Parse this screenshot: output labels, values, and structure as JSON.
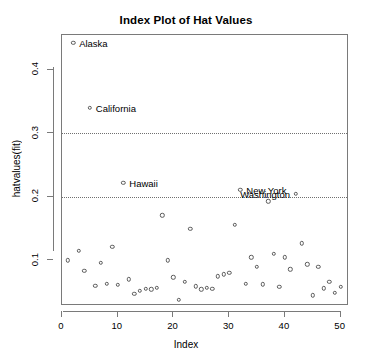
{
  "chart_data": {
    "type": "scatter",
    "title": "Index Plot of Hat Values",
    "xlabel": "Index",
    "ylabel": "hatvalues(fit)",
    "xlim": [
      0,
      51.5
    ],
    "ylim": [
      0.028,
      0.455
    ],
    "xticks": [
      0,
      10,
      20,
      30,
      40,
      50
    ],
    "xtick_labels": [
      "0",
      "10",
      "20",
      "30",
      "40",
      "50"
    ],
    "yticks": [
      0.1,
      0.2,
      0.3,
      0.4
    ],
    "ytick_labels": [
      "0.1",
      "0.2",
      "0.3",
      "0.4"
    ],
    "grid": false,
    "legend": null,
    "reference_lines": [
      {
        "y": 0.2,
        "style": "dotted",
        "color": "#707070"
      },
      {
        "y": 0.3,
        "style": "dotted",
        "color": "#707070"
      }
    ],
    "marker": {
      "shape": "circle-open",
      "color": "#5a5a5a",
      "size": 4.4
    },
    "x": [
      1,
      2,
      3,
      4,
      5,
      6,
      7,
      8,
      9,
      10,
      11,
      12,
      13,
      14,
      15,
      16,
      17,
      18,
      19,
      20,
      21,
      22,
      23,
      24,
      25,
      26,
      27,
      28,
      29,
      30,
      31,
      32,
      33,
      34,
      35,
      36,
      37,
      38,
      39,
      40,
      41,
      42,
      43,
      44,
      45,
      46,
      47,
      48,
      49,
      50
    ],
    "y": [
      0.1,
      0.443,
      0.115,
      0.083,
      0.34,
      0.06,
      0.096,
      0.063,
      0.121,
      0.061,
      0.222,
      0.07,
      0.047,
      0.052,
      0.055,
      0.054,
      0.057,
      0.171,
      0.1,
      0.073,
      0.038,
      0.066,
      0.15,
      0.059,
      0.054,
      0.057,
      0.055,
      0.075,
      0.078,
      0.08,
      0.156,
      0.211,
      0.063,
      0.105,
      0.09,
      0.062,
      0.193,
      0.11,
      0.058,
      0.105,
      0.086,
      0.205,
      0.127,
      0.094,
      0.045,
      0.09,
      0.056,
      0.066,
      0.049,
      0.058
    ],
    "annotations": [
      {
        "label": "Alaska",
        "index": 2,
        "value": 0.443,
        "side": "right"
      },
      {
        "label": "California",
        "index": 5,
        "value": 0.34,
        "side": "right"
      },
      {
        "label": "Hawaii",
        "index": 11,
        "value": 0.222,
        "side": "right"
      },
      {
        "label": "New York",
        "index": 32,
        "value": 0.211,
        "side": "right"
      },
      {
        "label": "Washington",
        "index": 42,
        "value": 0.205,
        "side": "left"
      }
    ]
  },
  "axis": {
    "title": "Index Plot of Hat Values",
    "x_title": "Index",
    "y_title": "hatvalues(fit)"
  }
}
